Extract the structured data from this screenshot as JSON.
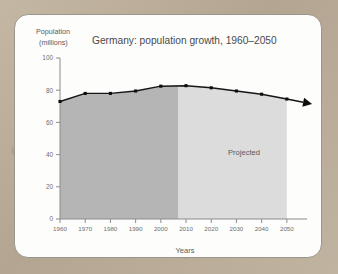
{
  "chart_data": {
    "type": "line",
    "title": "Germany: population growth, 1960–2050",
    "xlabel": "Years",
    "ylabel": "Population\n(millions)",
    "ylabel_line1": "Population",
    "ylabel_line2": "(millions)",
    "categories": [
      1960,
      1970,
      1980,
      1990,
      2000,
      2010,
      2020,
      2030,
      2040,
      2050
    ],
    "x": [
      1960,
      1970,
      1980,
      1990,
      2000,
      2010,
      2020,
      2030,
      2040,
      2050
    ],
    "values": [
      73,
      78,
      78,
      79.5,
      82.5,
      82.8,
      81.5,
      79.5,
      77.5,
      74.5
    ],
    "xtick_labels": [
      "1960",
      "1970",
      "1980",
      "1990",
      "2000",
      "2010",
      "2020",
      "2030",
      "2040",
      "2050"
    ],
    "ytick_labels": [
      "0",
      "20",
      "40",
      "60",
      "80",
      "100"
    ],
    "yticks": [
      0,
      20,
      40,
      60,
      80,
      100
    ],
    "ylim": [
      0,
      100
    ],
    "xlim": [
      1960,
      2058
    ],
    "grid": false,
    "legend": false,
    "annotations": [
      {
        "text": "Projected",
        "x": 2033,
        "y": 40
      }
    ],
    "regions": [
      {
        "name": "historical",
        "x_start": 1960,
        "x_end": 2007,
        "color": "#b5b5b5"
      },
      {
        "name": "projected",
        "x_start": 2007,
        "x_end": 2050,
        "color": "#dcdcdc"
      }
    ],
    "series_color": "#151515",
    "has_end_arrow": true
  },
  "colors": {
    "card_background": "#fdfdfc",
    "card_border": "#9a958e",
    "page_background": "#bdb09c",
    "axis": "#8c8c8c",
    "text": "#5c5c5c",
    "title_text": "#4a4a4a",
    "historical_fill": "#b5b5b5",
    "projected_fill": "#dcdcdc",
    "line": "#151515"
  }
}
